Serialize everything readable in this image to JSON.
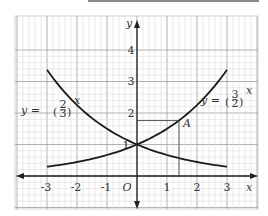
{
  "chart_data": {
    "type": "line",
    "title": "",
    "xlabel": "x",
    "ylabel": "y",
    "origin_label": "O",
    "xlim": [
      -3.7,
      4.0
    ],
    "ylim": [
      -1.0,
      4.9
    ],
    "x_ticks": [
      "-3",
      "-2",
      "-1",
      "1",
      "2",
      "3"
    ],
    "y_ticks": [
      "1",
      "2",
      "3",
      "4"
    ],
    "grid": true,
    "series": [
      {
        "name": "y = (2/3)^x",
        "label_base": "y = ",
        "label_num": "2",
        "label_den": "3",
        "label_exp": "x",
        "x": [
          -3,
          -2,
          -1,
          0,
          1,
          2,
          3
        ],
        "values": [
          3.375,
          2.25,
          1.5,
          1.0,
          0.667,
          0.444,
          0.296
        ]
      },
      {
        "name": "y = (3/2)^x",
        "label_base": "y = ",
        "label_num": "3",
        "label_den": "2",
        "label_exp": "x",
        "x": [
          -3,
          -2,
          -1,
          0,
          1,
          2,
          3
        ],
        "values": [
          0.296,
          0.444,
          0.667,
          1.0,
          1.5,
          2.25,
          3.375
        ]
      }
    ],
    "annotations": [
      {
        "label": "A",
        "x": 1.4,
        "y": 1.76,
        "note": "point on y=(3/2)^x with dashed guides to axes"
      }
    ]
  }
}
